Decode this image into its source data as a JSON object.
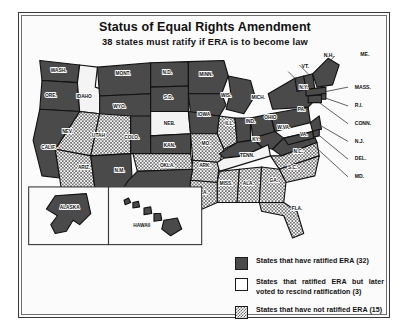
{
  "header": {
    "title": "Status of Equal Rights Amendment",
    "subtitle": "38 states must ratify if ERA is to become law"
  },
  "legend": {
    "items": [
      {
        "swatch": "dark-gray-solid",
        "label": "States that have ratified ERA (32)",
        "count": 32,
        "color": "#4a4a4a"
      },
      {
        "swatch": "white-solid",
        "label": "States that ratified ERA but later voted to rescind ratification (3)",
        "count": 3,
        "color": "#ffffff"
      },
      {
        "swatch": "gray-hatched",
        "label": "States that have not ratified ERA (15)",
        "count": 15,
        "color": "#6a6a6a"
      }
    ]
  },
  "map": {
    "inset_labels": {
      "alaska": "ALASKA",
      "hawaii": "HAWAII"
    },
    "states": [
      {
        "abbr": "WASH.",
        "status": "ratified",
        "x": 33,
        "y": 22
      },
      {
        "abbr": "ORE.",
        "status": "ratified",
        "x": 26,
        "y": 45
      },
      {
        "abbr": "IDAHO",
        "status": "rescind",
        "x": 56,
        "y": 46
      },
      {
        "abbr": "MONT.",
        "status": "ratified",
        "x": 91,
        "y": 25
      },
      {
        "abbr": "N.D.",
        "status": "ratified",
        "x": 131,
        "y": 24
      },
      {
        "abbr": "MINN.",
        "status": "ratified",
        "x": 166,
        "y": 26
      },
      {
        "abbr": "WYO.",
        "status": "ratified",
        "x": 88,
        "y": 55
      },
      {
        "abbr": "S.D.",
        "status": "ratified",
        "x": 132,
        "y": 47
      },
      {
        "abbr": "WIS.",
        "status": "ratified",
        "x": 184,
        "y": 45
      },
      {
        "abbr": "MICH.",
        "status": "ratified",
        "x": 213,
        "y": 47
      },
      {
        "abbr": "NEV.",
        "status": "not-ratified",
        "x": 41,
        "y": 77
      },
      {
        "abbr": "UTAH",
        "status": "not-ratified",
        "x": 69,
        "y": 81
      },
      {
        "abbr": "COLO.",
        "status": "ratified",
        "x": 99,
        "y": 83
      },
      {
        "abbr": "NEB.",
        "status": "rescind",
        "x": 133,
        "y": 70
      },
      {
        "abbr": "IOWA",
        "status": "ratified",
        "x": 164,
        "y": 62
      },
      {
        "abbr": "ILL.",
        "status": "not-ratified",
        "x": 187,
        "y": 70
      },
      {
        "abbr": "IND.",
        "status": "ratified",
        "x": 206,
        "y": 68
      },
      {
        "abbr": "OHIO",
        "status": "ratified",
        "x": 224,
        "y": 65
      },
      {
        "abbr": "PA.",
        "status": "ratified",
        "x": 252,
        "y": 58
      },
      {
        "abbr": "N.Y.",
        "status": "ratified",
        "x": 254,
        "y": 38
      },
      {
        "abbr": "CALIF.",
        "status": "ratified",
        "x": 24,
        "y": 92
      },
      {
        "abbr": "ARIZ.",
        "status": "not-ratified",
        "x": 56,
        "y": 110
      },
      {
        "abbr": "N.M.",
        "status": "ratified",
        "x": 88,
        "y": 113
      },
      {
        "abbr": "KAN.",
        "status": "ratified",
        "x": 133,
        "y": 90
      },
      {
        "abbr": "MO.",
        "status": "not-ratified",
        "x": 166,
        "y": 88
      },
      {
        "abbr": "KY.",
        "status": "ratified",
        "x": 211,
        "y": 85
      },
      {
        "abbr": "W.VA.",
        "status": "ratified",
        "x": 236,
        "y": 74
      },
      {
        "abbr": "VA.",
        "status": "ratified",
        "x": 254,
        "y": 80
      },
      {
        "abbr": "OKLA.",
        "status": "not-ratified",
        "x": 131,
        "y": 108
      },
      {
        "abbr": "ARK.",
        "status": "not-ratified",
        "x": 165,
        "y": 108
      },
      {
        "abbr": "TENN.",
        "status": "rescind",
        "x": 203,
        "y": 99
      },
      {
        "abbr": "N.C.",
        "status": "not-ratified",
        "x": 249,
        "y": 95
      },
      {
        "abbr": "S.C.",
        "status": "not-ratified",
        "x": 244,
        "y": 110
      },
      {
        "abbr": "MISS.",
        "status": "not-ratified",
        "x": 184,
        "y": 124
      },
      {
        "abbr": "ALA.",
        "status": "not-ratified",
        "x": 204,
        "y": 124
      },
      {
        "abbr": "GA.",
        "status": "not-ratified",
        "x": 227,
        "y": 122
      },
      {
        "abbr": "LA.",
        "status": "not-ratified",
        "x": 164,
        "y": 132
      },
      {
        "abbr": "TEXAS",
        "status": "ratified",
        "x": 120,
        "y": 138
      },
      {
        "abbr": "FLA.",
        "status": "not-ratified",
        "x": 248,
        "y": 147
      }
    ],
    "leader_labels": [
      {
        "abbr": "N.H.",
        "x": 272,
        "y": 9
      },
      {
        "abbr": "ME.",
        "x": 305,
        "y": 8
      },
      {
        "abbr": "VT.",
        "x": 252,
        "y": 19
      },
      {
        "abbr": "MASS.",
        "x": 300,
        "y": 38
      },
      {
        "abbr": "R.I.",
        "x": 300,
        "y": 54
      },
      {
        "abbr": "CONN.",
        "x": 300,
        "y": 70
      },
      {
        "abbr": "N.J.",
        "x": 300,
        "y": 86
      },
      {
        "abbr": "DEL.",
        "x": 300,
        "y": 102
      },
      {
        "abbr": "MD.",
        "x": 300,
        "y": 118
      }
    ]
  }
}
